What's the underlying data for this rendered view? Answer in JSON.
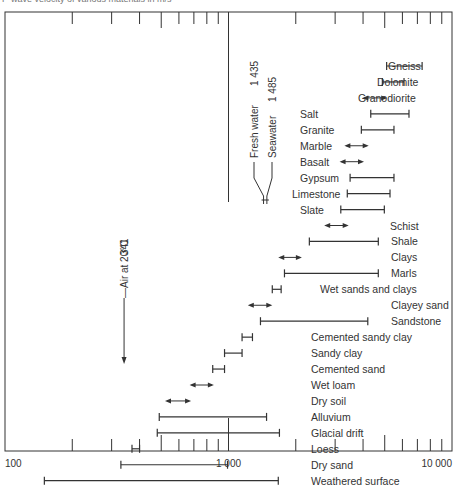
{
  "title": "P-wave velocity of various materials in m/s",
  "chart_data": {
    "type": "range",
    "title": "P-wave velocity of various materials in m/s",
    "xlabel": "",
    "ylabel": "",
    "xscale": "log",
    "xlim": [
      100,
      10000
    ],
    "x_ticks": [
      {
        "value": 100,
        "label": "100"
      },
      {
        "value": 1000,
        "label": "1 000"
      },
      {
        "value": 10000,
        "label": "10 000"
      }
    ],
    "items": [
      {
        "label": "Gneiss",
        "min": 5100,
        "max": 7350,
        "style": "bar",
        "label_x": 388
      },
      {
        "label": "Dolomite",
        "min": 4880,
        "max": 6100,
        "style": "bar",
        "label_x": 377
      },
      {
        "label": "Granodiorite",
        "min": 3970,
        "max": 5130,
        "style": "arrow",
        "label_x": 358
      },
      {
        "label": "Salt",
        "min": 4330,
        "max": 6420,
        "style": "bar",
        "label_x": 300
      },
      {
        "label": "Granite",
        "min": 3930,
        "max": 5500,
        "style": "bar",
        "label_x": 300
      },
      {
        "label": "Marble",
        "min": 3300,
        "max": 4240,
        "style": "arrow",
        "label_x": 300
      },
      {
        "label": "Basalt",
        "min": 3140,
        "max": 4040,
        "style": "arrow",
        "label_x": 300
      },
      {
        "label": "Gypsum",
        "min": 3500,
        "max": 5500,
        "style": "bar",
        "label_x": 300
      },
      {
        "label": "Limestone",
        "min": 3400,
        "max": 5280,
        "style": "bar",
        "label_x": 292
      },
      {
        "label": "Slate",
        "min": 3180,
        "max": 4980,
        "style": "bar",
        "label_x": 300
      },
      {
        "label": "Schist",
        "min": 2680,
        "max": 3450,
        "style": "arrow",
        "label_x": 390
      },
      {
        "label": "Shale",
        "min": 2300,
        "max": 4680,
        "style": "bar",
        "label_x": 391
      },
      {
        "label": "Clays",
        "min": 1670,
        "max": 2130,
        "style": "arrow",
        "label_x": 391
      },
      {
        "label": "Marls",
        "min": 1780,
        "max": 4680,
        "style": "bar",
        "label_x": 391
      },
      {
        "label": "Wet sands and clays",
        "min": 1570,
        "max": 1720,
        "style": "bar",
        "label_x": 320
      },
      {
        "label": "Clayey sand",
        "min": 1220,
        "max": 1570,
        "style": "arrow",
        "label_x": 391
      },
      {
        "label": "Sandstone",
        "min": 1390,
        "max": 4200,
        "style": "bar",
        "label_x": 391
      },
      {
        "label": "Cemented sandy clay",
        "min": 1150,
        "max": 1280,
        "style": "bar",
        "label_x": 311
      },
      {
        "label": "Sandy clay",
        "min": 960,
        "max": 1150,
        "style": "bar",
        "label_x": 311
      },
      {
        "label": "Cemented sand",
        "min": 850,
        "max": 960,
        "style": "bar",
        "label_x": 311
      },
      {
        "label": "Wet loam",
        "min": 670,
        "max": 860,
        "style": "arrow",
        "label_x": 311
      },
      {
        "label": "Dry soil",
        "min": 520,
        "max": 680,
        "style": "arrow",
        "label_x": 311
      },
      {
        "label": "Alluvium",
        "min": 490,
        "max": 1480,
        "style": "bar",
        "label_x": 311
      },
      {
        "label": "Glacial drift",
        "min": 480,
        "max": 1690,
        "style": "bar",
        "label_x": 311
      },
      {
        "label": "Loess",
        "min": 370,
        "max": 400,
        "style": "bar",
        "label_x": 311
      },
      {
        "label": "Dry sand",
        "min": 330,
        "max": 990,
        "style": "bar",
        "label_x": 311
      },
      {
        "label": "Weathered surface",
        "min": 150,
        "max": 1670,
        "style": "bar",
        "label_x": 311
      }
    ],
    "annotations": [
      {
        "label": "Air at 20°C",
        "value": 341,
        "value_label": "341"
      },
      {
        "label": "Fresh water",
        "value": 1435,
        "value_label": "1 435"
      },
      {
        "label": "Seawater",
        "value": 1485,
        "value_label": "1 485"
      }
    ],
    "grid": false
  }
}
